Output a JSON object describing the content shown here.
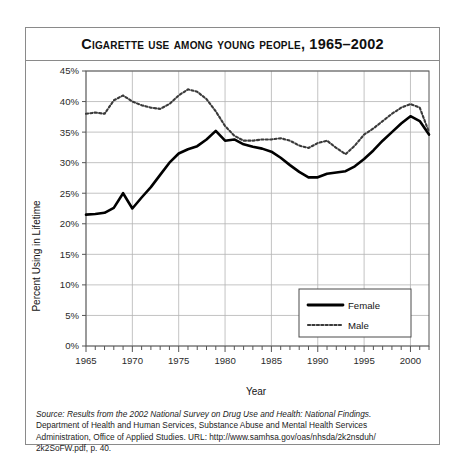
{
  "figure": {
    "title": "Cigarette Use among Young People, 1965–2002",
    "source_lines": [
      "Source: Results from the 2002 National Survey on Drug Use and Health: National Findings.",
      "Department of Health and Human Services, Substance Abuse and Mental Health Services",
      "Administration, Office of Applied Studies. URL: http://www.samhsa.gov/oas/nhsda/2k2nsduh/",
      "2k2SoFW.pdf, p. 40."
    ]
  },
  "chart_data": {
    "type": "line",
    "title": "Cigarette Use among Young People, 1965–2002",
    "xlabel": "Year",
    "ylabel": "Percent Using in Lifetime",
    "xlim": [
      1965,
      2002
    ],
    "ylim": [
      0,
      45
    ],
    "ytick_labels": [
      "0%",
      "5%",
      "10%",
      "15%",
      "20%",
      "25%",
      "30%",
      "35%",
      "40%",
      "45%"
    ],
    "ytick_values": [
      0,
      5,
      10,
      15,
      20,
      25,
      30,
      35,
      40,
      45
    ],
    "xtick_labels": [
      "1965",
      "1970",
      "1975",
      "1980",
      "1985",
      "1990",
      "1995",
      "2000"
    ],
    "xtick_values": [
      1965,
      1970,
      1975,
      1980,
      1985,
      1990,
      1995,
      2000
    ],
    "minor_xticks_every": 1,
    "grid": true,
    "legend_position": "lower right",
    "x": [
      1965,
      1966,
      1967,
      1968,
      1969,
      1970,
      1971,
      1972,
      1973,
      1974,
      1975,
      1976,
      1977,
      1978,
      1979,
      1980,
      1981,
      1982,
      1983,
      1984,
      1985,
      1986,
      1987,
      1988,
      1989,
      1990,
      1991,
      1992,
      1993,
      1994,
      1995,
      1996,
      1997,
      1998,
      1999,
      2000,
      2001,
      2002
    ],
    "series": [
      {
        "name": "Female",
        "style": "solid",
        "color": "#000000",
        "values": [
          21.5,
          21.6,
          21.8,
          22.6,
          25.0,
          22.5,
          24.3,
          26.0,
          28.0,
          30.0,
          31.5,
          32.2,
          32.7,
          33.8,
          35.2,
          33.6,
          33.8,
          33.0,
          32.6,
          32.3,
          31.8,
          30.8,
          29.6,
          28.5,
          27.6,
          27.6,
          28.2,
          28.4,
          28.6,
          29.4,
          30.6,
          32.0,
          33.6,
          35.0,
          36.4,
          37.6,
          36.8,
          34.6
        ]
      },
      {
        "name": "Male",
        "style": "dotted",
        "color": "#3a3a3a",
        "values": [
          38.0,
          38.2,
          38.0,
          40.2,
          41.0,
          40.0,
          39.4,
          39.0,
          38.8,
          39.6,
          41.0,
          42.0,
          41.6,
          40.4,
          38.4,
          36.0,
          34.4,
          33.6,
          33.6,
          33.8,
          33.8,
          34.0,
          33.6,
          32.8,
          32.4,
          33.2,
          33.6,
          32.4,
          31.4,
          32.8,
          34.6,
          35.6,
          36.8,
          38.0,
          39.0,
          39.6,
          39.0,
          35.0
        ]
      }
    ]
  },
  "legend": {
    "items": [
      {
        "label": "Female",
        "style": "solid"
      },
      {
        "label": "Male",
        "style": "dotted"
      }
    ]
  }
}
